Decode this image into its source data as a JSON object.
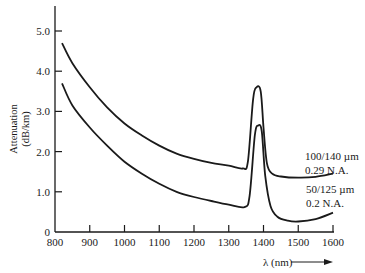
{
  "chart_data": {
    "type": "line",
    "title": "",
    "xlabel": "λ (nm)",
    "ylabel": "Attenuation (dB/km)",
    "ylabel_lines": [
      "Attenuation",
      "(dB/km)"
    ],
    "xlim": [
      800,
      1600
    ],
    "ylim": [
      0,
      5.0
    ],
    "x_ticks": [
      800,
      900,
      1000,
      1100,
      1200,
      1300,
      1400,
      1500,
      1600
    ],
    "y_ticks": [
      0,
      1.0,
      2.0,
      3.0,
      4.0,
      5.0
    ],
    "y_tick_labels": [
      "0",
      "1.0",
      "2.0",
      "3.0",
      "4.0",
      "5.0"
    ],
    "grid": false,
    "series": [
      {
        "name": "100/140 µm 0.29 N.A.",
        "label_lines": [
          "100/140 µm",
          "0.29 N.A."
        ],
        "points": [
          [
            820,
            4.7
          ],
          [
            850,
            4.2
          ],
          [
            900,
            3.6
          ],
          [
            950,
            3.1
          ],
          [
            1000,
            2.7
          ],
          [
            1050,
            2.4
          ],
          [
            1100,
            2.15
          ],
          [
            1150,
            1.95
          ],
          [
            1200,
            1.82
          ],
          [
            1250,
            1.72
          ],
          [
            1300,
            1.65
          ],
          [
            1340,
            1.58
          ],
          [
            1355,
            1.75
          ],
          [
            1370,
            3.3
          ],
          [
            1380,
            3.6
          ],
          [
            1392,
            3.5
          ],
          [
            1400,
            2.6
          ],
          [
            1410,
            1.7
          ],
          [
            1425,
            1.45
          ],
          [
            1450,
            1.38
          ],
          [
            1500,
            1.35
          ],
          [
            1550,
            1.37
          ],
          [
            1600,
            1.45
          ]
        ]
      },
      {
        "name": "50/125 µm 0.2 N.A.",
        "label_lines": [
          "50/125 µm",
          "0.2 N.A."
        ],
        "points": [
          [
            820,
            3.7
          ],
          [
            850,
            3.15
          ],
          [
            900,
            2.6
          ],
          [
            950,
            2.15
          ],
          [
            1000,
            1.75
          ],
          [
            1050,
            1.45
          ],
          [
            1100,
            1.2
          ],
          [
            1150,
            1.0
          ],
          [
            1200,
            0.87
          ],
          [
            1250,
            0.77
          ],
          [
            1300,
            0.68
          ],
          [
            1345,
            0.62
          ],
          [
            1360,
            0.9
          ],
          [
            1375,
            2.4
          ],
          [
            1385,
            2.65
          ],
          [
            1395,
            2.5
          ],
          [
            1405,
            1.4
          ],
          [
            1420,
            0.65
          ],
          [
            1440,
            0.38
          ],
          [
            1470,
            0.28
          ],
          [
            1500,
            0.26
          ],
          [
            1550,
            0.32
          ],
          [
            1600,
            0.48
          ]
        ]
      }
    ]
  }
}
